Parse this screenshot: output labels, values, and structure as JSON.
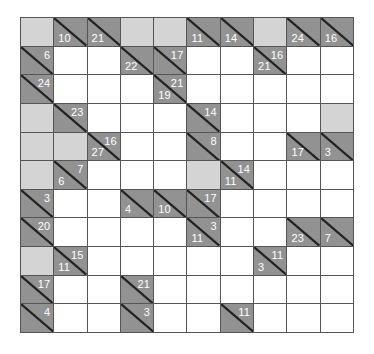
{
  "puzzle": {
    "type": "kakuro",
    "cols": 10,
    "rows": 11,
    "colors": {
      "clue_cell": "#8c8c8c",
      "blank_cell": "#d4d4d4",
      "entry_cell": "#ffffff",
      "grid_line": "#555555",
      "clue_text": "#ffffff"
    },
    "grid": [
      [
        {
          "t": "b"
        },
        {
          "t": "c",
          "d": "10"
        },
        {
          "t": "c",
          "d": "21"
        },
        {
          "t": "b"
        },
        {
          "t": "b"
        },
        {
          "t": "c",
          "d": "11"
        },
        {
          "t": "c",
          "d": "14"
        },
        {
          "t": "b"
        },
        {
          "t": "c",
          "d": "24"
        },
        {
          "t": "c",
          "d": "16"
        }
      ],
      [
        {
          "t": "c",
          "r": "6"
        },
        {
          "t": "w"
        },
        {
          "t": "w"
        },
        {
          "t": "c",
          "d": "22"
        },
        {
          "t": "c",
          "r": "17"
        },
        {
          "t": "w"
        },
        {
          "t": "w"
        },
        {
          "t": "c",
          "d": "21",
          "r": "16"
        },
        {
          "t": "w"
        },
        {
          "t": "w"
        }
      ],
      [
        {
          "t": "c",
          "r": "24"
        },
        {
          "t": "w"
        },
        {
          "t": "w"
        },
        {
          "t": "w"
        },
        {
          "t": "c",
          "d": "19",
          "r": "21"
        },
        {
          "t": "w"
        },
        {
          "t": "w"
        },
        {
          "t": "w"
        },
        {
          "t": "w"
        },
        {
          "t": "w"
        }
      ],
      [
        {
          "t": "b"
        },
        {
          "t": "c",
          "r": "23"
        },
        {
          "t": "w"
        },
        {
          "t": "w"
        },
        {
          "t": "w"
        },
        {
          "t": "c",
          "r": "14"
        },
        {
          "t": "w"
        },
        {
          "t": "w"
        },
        {
          "t": "w"
        },
        {
          "t": "b"
        }
      ],
      [
        {
          "t": "b"
        },
        {
          "t": "b"
        },
        {
          "t": "c",
          "d": "27",
          "r": "16"
        },
        {
          "t": "w"
        },
        {
          "t": "w"
        },
        {
          "t": "c",
          "r": "8"
        },
        {
          "t": "w"
        },
        {
          "t": "w"
        },
        {
          "t": "c",
          "d": "17"
        },
        {
          "t": "c",
          "d": "3"
        }
      ],
      [
        {
          "t": "b"
        },
        {
          "t": "c",
          "d": "6",
          "r": "7"
        },
        {
          "t": "w"
        },
        {
          "t": "w"
        },
        {
          "t": "w"
        },
        {
          "t": "b"
        },
        {
          "t": "c",
          "d": "11",
          "r": "14"
        },
        {
          "t": "w"
        },
        {
          "t": "w"
        },
        {
          "t": "w"
        }
      ],
      [
        {
          "t": "c",
          "r": "3"
        },
        {
          "t": "w"
        },
        {
          "t": "w"
        },
        {
          "t": "c",
          "d": "4"
        },
        {
          "t": "c",
          "d": "10"
        },
        {
          "t": "c",
          "r": "17"
        },
        {
          "t": "w"
        },
        {
          "t": "w"
        },
        {
          "t": "w"
        },
        {
          "t": "w"
        }
      ],
      [
        {
          "t": "c",
          "r": "20"
        },
        {
          "t": "w"
        },
        {
          "t": "w"
        },
        {
          "t": "w"
        },
        {
          "t": "w"
        },
        {
          "t": "c",
          "d": "11",
          "r": "3"
        },
        {
          "t": "w"
        },
        {
          "t": "w"
        },
        {
          "t": "c",
          "d": "23"
        },
        {
          "t": "c",
          "d": "7"
        }
      ],
      [
        {
          "t": "b"
        },
        {
          "t": "c",
          "d": "11",
          "r": "15"
        },
        {
          "t": "w"
        },
        {
          "t": "w"
        },
        {
          "t": "w"
        },
        {
          "t": "w"
        },
        {
          "t": "w"
        },
        {
          "t": "c",
          "d": "3",
          "r": "11"
        },
        {
          "t": "w"
        },
        {
          "t": "w"
        }
      ],
      [
        {
          "t": "c",
          "r": "17"
        },
        {
          "t": "w"
        },
        {
          "t": "w"
        },
        {
          "t": "c",
          "r": "21"
        },
        {
          "t": "w"
        },
        {
          "t": "w"
        },
        {
          "t": "w"
        },
        {
          "t": "w"
        },
        {
          "t": "w"
        },
        {
          "t": "w"
        }
      ],
      [
        {
          "t": "c",
          "r": "4"
        },
        {
          "t": "w"
        },
        {
          "t": "w"
        },
        {
          "t": "c",
          "r": "3"
        },
        {
          "t": "w"
        },
        {
          "t": "w"
        },
        {
          "t": "c",
          "r": "11"
        },
        {
          "t": "w"
        },
        {
          "t": "w"
        },
        {
          "t": "w"
        }
      ]
    ]
  }
}
